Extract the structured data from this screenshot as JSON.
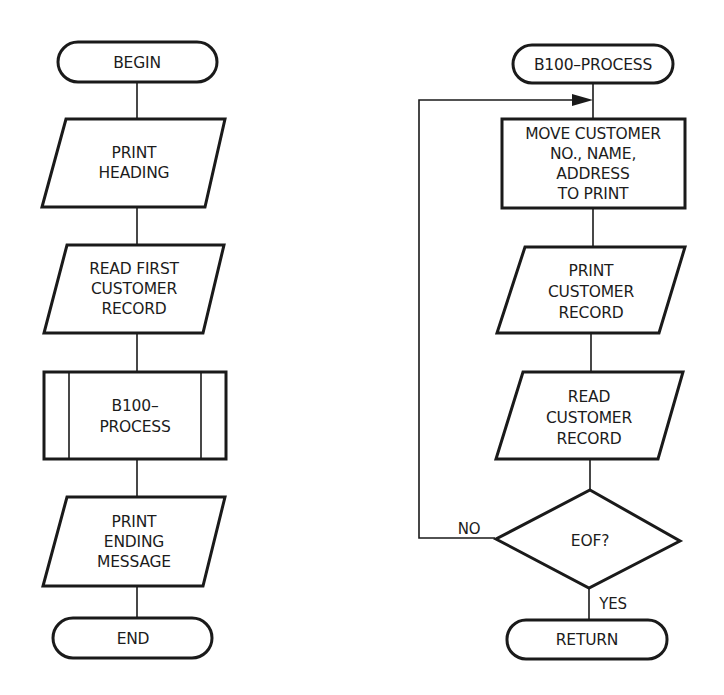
{
  "diagram": {
    "type": "flowchart",
    "colors": {
      "stroke": "#1a1a1a",
      "text": "#1c1c1c",
      "background": "#ffffff"
    },
    "main_flow": {
      "nodes": [
        {
          "id": "begin",
          "shape": "terminal",
          "lines": [
            "BEGIN"
          ]
        },
        {
          "id": "print-heading",
          "shape": "io-parallelogram",
          "lines": [
            "PRINT",
            "HEADING"
          ]
        },
        {
          "id": "read-first",
          "shape": "io-parallelogram",
          "lines": [
            "READ FIRST",
            "CUSTOMER",
            "RECORD"
          ]
        },
        {
          "id": "b100-call",
          "shape": "predefined-process",
          "lines": [
            "B100–",
            "PROCESS"
          ]
        },
        {
          "id": "print-ending",
          "shape": "io-parallelogram",
          "lines": [
            "PRINT",
            "ENDING",
            "MESSAGE"
          ]
        },
        {
          "id": "end",
          "shape": "terminal",
          "lines": [
            "END"
          ]
        }
      ]
    },
    "subroutine": {
      "nodes": [
        {
          "id": "b100-start",
          "shape": "terminal",
          "lines": [
            "B100–PROCESS"
          ]
        },
        {
          "id": "move",
          "shape": "process",
          "lines": [
            "MOVE CUSTOMER",
            "NO., NAME,",
            "ADDRESS",
            "TO PRINT"
          ]
        },
        {
          "id": "print-customer",
          "shape": "io-parallelogram",
          "lines": [
            "PRINT",
            "CUSTOMER",
            "RECORD"
          ]
        },
        {
          "id": "read-customer",
          "shape": "io-parallelogram",
          "lines": [
            "READ",
            "CUSTOMER",
            "RECORD"
          ]
        },
        {
          "id": "eof",
          "shape": "decision",
          "lines": [
            "EOF?"
          ]
        },
        {
          "id": "return",
          "shape": "terminal",
          "lines": [
            "RETURN"
          ]
        }
      ],
      "edge_labels": {
        "no": "NO",
        "yes": "YES"
      }
    }
  }
}
